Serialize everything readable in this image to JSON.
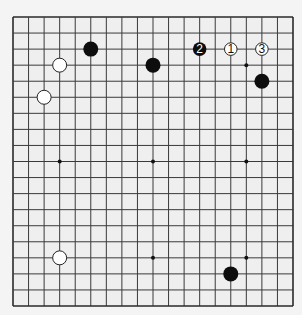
{
  "diagram": {
    "type": "go-board",
    "size": 19,
    "colors": {
      "page_background": "#f4f4f4",
      "board_background": "#efefef",
      "grid_line": "#3a3a3a",
      "border_line": "#2a2a2a",
      "star_point": "#111111",
      "black_stone": "#0d0d0d",
      "white_stone_fill": "#ffffff",
      "white_stone_edge": "#222222"
    },
    "geometry": {
      "origin_x": 13,
      "origin_y": 17,
      "end_x": 293,
      "end_y": 306,
      "stone_radius": 7.5,
      "numbered_stone_radius": 6.8,
      "star_radius": 2
    },
    "star_points": [
      [
        3,
        3
      ],
      [
        9,
        3
      ],
      [
        15,
        3
      ],
      [
        3,
        9
      ],
      [
        9,
        9
      ],
      [
        15,
        9
      ],
      [
        3,
        15
      ],
      [
        9,
        15
      ],
      [
        15,
        15
      ]
    ],
    "stones": [
      {
        "color": "black",
        "col": 5,
        "row": 2,
        "label": ""
      },
      {
        "color": "black",
        "col": 9,
        "row": 3,
        "label": ""
      },
      {
        "color": "black",
        "col": 16,
        "row": 4,
        "label": ""
      },
      {
        "color": "black",
        "col": 14,
        "row": 16,
        "label": ""
      },
      {
        "color": "white",
        "col": 3,
        "row": 3,
        "label": ""
      },
      {
        "color": "white",
        "col": 2,
        "row": 5,
        "label": ""
      },
      {
        "color": "white",
        "col": 3,
        "row": 15,
        "label": ""
      },
      {
        "color": "white",
        "col": 14,
        "row": 2,
        "label": "1"
      },
      {
        "color": "black",
        "col": 12,
        "row": 2,
        "label": "2"
      },
      {
        "color": "white",
        "col": 16,
        "row": 2,
        "label": "3"
      }
    ],
    "move_sequence": [
      "1",
      "2",
      "3"
    ]
  }
}
